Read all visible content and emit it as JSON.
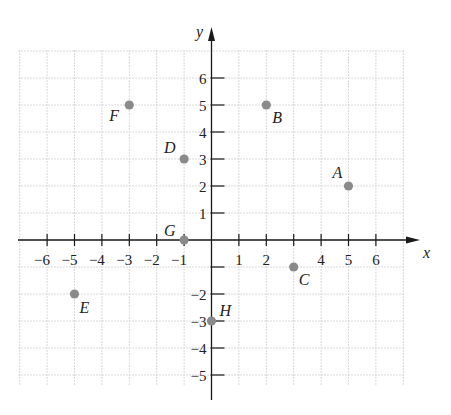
{
  "chart_data": {
    "type": "scatter",
    "title": "",
    "xlabel": "x",
    "ylabel": "y",
    "xlim": [
      -7,
      7
    ],
    "ylim": [
      -6,
      7
    ],
    "grid": true,
    "x_ticks": [
      -6,
      -5,
      -4,
      -3,
      -2,
      -1,
      1,
      2,
      4,
      5,
      6
    ],
    "y_ticks": [
      -5,
      -4,
      -3,
      -2,
      1,
      2,
      3,
      4,
      5,
      6
    ],
    "points": [
      {
        "label": "A",
        "x": 5,
        "y": 2
      },
      {
        "label": "B",
        "x": 2,
        "y": 5
      },
      {
        "label": "C",
        "x": 3,
        "y": -1
      },
      {
        "label": "D",
        "x": -1,
        "y": 3
      },
      {
        "label": "E",
        "x": -5,
        "y": -2
      },
      {
        "label": "F",
        "x": -3,
        "y": 5
      },
      {
        "label": "G",
        "x": -1,
        "y": 0
      },
      {
        "label": "H",
        "x": 0,
        "y": -3
      }
    ],
    "colors": {
      "point": "#8a8a8a",
      "axis": "#1a1a1a",
      "grid": "#d9d9d9"
    }
  }
}
